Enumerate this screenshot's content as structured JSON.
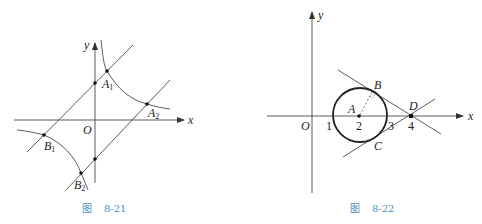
{
  "figures": [
    {
      "id": "fig-8-21",
      "caption": {
        "prefix": "图",
        "number": "8-21"
      },
      "axes": {
        "x_label": "x",
        "y_label": "y",
        "origin_label": "O"
      },
      "points": {
        "A1": {
          "name": "A",
          "sub": "1"
        },
        "A2": {
          "name": "A",
          "sub": "2"
        },
        "B1": {
          "name": "B",
          "sub": "1"
        },
        "B2": {
          "name": "B",
          "sub": "2"
        }
      },
      "description": "Two parallel lines intersecting both branches of a hyperbola (y = k/x type); upper line meets the upper-right branch at A1, A2 and lower line meets lower-left branch at B1, B2"
    },
    {
      "id": "fig-8-22",
      "caption": {
        "prefix": "图",
        "number": "8-22"
      },
      "axes": {
        "x_label": "x",
        "y_label": "y",
        "origin_label": "O"
      },
      "ticks": [
        "1",
        "2",
        "3",
        "4"
      ],
      "points": {
        "A": "A",
        "B": "B",
        "C": "C",
        "D": "D"
      },
      "description": "Circle centered at A(2,0) with radius 1; two tangent lines from D(4,0) touch the circle at B and C; dashed radius AB with right-angle mark"
    }
  ]
}
